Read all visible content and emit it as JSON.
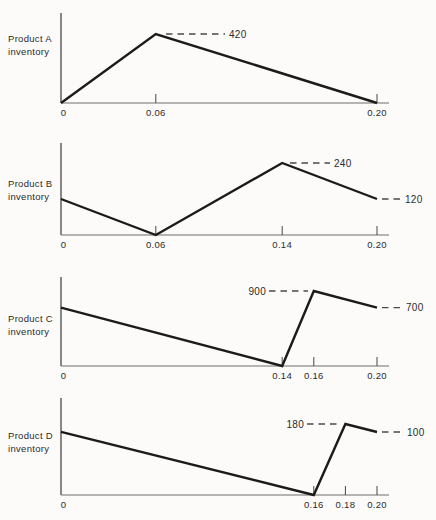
{
  "figure": {
    "background_color": "#fcfbf9",
    "line_color": "#1b1b1b",
    "axis_color": "#555555",
    "dash_color": "#4a4a4a",
    "text_color": "#2b2b2b"
  },
  "chart_data": [
    {
      "type": "line",
      "ylabel": "Product A inventory",
      "xlabel": "",
      "product_label": [
        "Product A",
        "inventory"
      ],
      "x_range": [
        0,
        0.2
      ],
      "grid": false,
      "legend": false,
      "points": [
        {
          "x": 0,
          "y": 0
        },
        {
          "x": 0.06,
          "y": 420
        },
        {
          "x": 0.2,
          "y": 0
        }
      ],
      "x_ticks": [
        {
          "x": 0,
          "label": "0",
          "mark": false
        },
        {
          "x": 0.06,
          "label": "0.06",
          "mark": true
        },
        {
          "x": 0.2,
          "label": "0.20",
          "mark": true
        }
      ],
      "annotations": [
        {
          "label": "420",
          "value": 420,
          "x": 0.06,
          "side": "right"
        }
      ]
    },
    {
      "type": "line",
      "ylabel": "Product B inventory",
      "xlabel": "",
      "product_label": [
        "Product B",
        "inventory"
      ],
      "x_range": [
        0,
        0.2
      ],
      "grid": false,
      "legend": false,
      "points": [
        {
          "x": 0,
          "y": 120
        },
        {
          "x": 0.06,
          "y": 0
        },
        {
          "x": 0.14,
          "y": 240
        },
        {
          "x": 0.2,
          "y": 120
        }
      ],
      "x_ticks": [
        {
          "x": 0,
          "label": "0",
          "mark": false
        },
        {
          "x": 0.06,
          "label": "0.06",
          "mark": true
        },
        {
          "x": 0.14,
          "label": "0.14",
          "mark": true
        },
        {
          "x": 0.2,
          "label": "0.20",
          "mark": true
        }
      ],
      "annotations": [
        {
          "label": "240",
          "value": 240,
          "x": 0.14,
          "side": "right"
        },
        {
          "label": "120",
          "value": 120,
          "x": 0.2,
          "side": "right"
        }
      ]
    },
    {
      "type": "line",
      "ylabel": "Product C inventory",
      "xlabel": "",
      "product_label": [
        "Product C",
        "inventory"
      ],
      "x_range": [
        0,
        0.2
      ],
      "grid": false,
      "legend": false,
      "points": [
        {
          "x": 0,
          "y": 700
        },
        {
          "x": 0.14,
          "y": 0
        },
        {
          "x": 0.16,
          "y": 900
        },
        {
          "x": 0.2,
          "y": 700
        }
      ],
      "x_ticks": [
        {
          "x": 0,
          "label": "0",
          "mark": false
        },
        {
          "x": 0.14,
          "label": "0.14",
          "mark": true
        },
        {
          "x": 0.16,
          "label": "0.16",
          "mark": true
        },
        {
          "x": 0.2,
          "label": "0.20",
          "mark": true
        }
      ],
      "annotations": [
        {
          "label": "900",
          "value": 900,
          "x": 0.16,
          "side": "left"
        },
        {
          "label": "700",
          "value": 700,
          "x": 0.2,
          "side": "right"
        }
      ]
    },
    {
      "type": "line",
      "ylabel": "Product D inventory",
      "xlabel": "",
      "product_label": [
        "Product D",
        "inventory"
      ],
      "x_range": [
        0,
        0.2
      ],
      "grid": false,
      "legend": false,
      "points": [
        {
          "x": 0,
          "y": 160
        },
        {
          "x": 0.16,
          "y": 0
        },
        {
          "x": 0.18,
          "y": 180
        },
        {
          "x": 0.2,
          "y": 100
        }
      ],
      "x_ticks": [
        {
          "x": 0,
          "label": "0",
          "mark": false
        },
        {
          "x": 0.16,
          "label": "0.16",
          "mark": true
        },
        {
          "x": 0.18,
          "label": "0.18",
          "mark": true
        },
        {
          "x": 0.2,
          "label": "0.20",
          "mark": true
        }
      ],
      "annotations": [
        {
          "label": "180",
          "value": 180,
          "x": 0.18,
          "side": "left"
        },
        {
          "label": "100",
          "value": 100,
          "x": 0.2,
          "side": "right"
        }
      ]
    }
  ]
}
